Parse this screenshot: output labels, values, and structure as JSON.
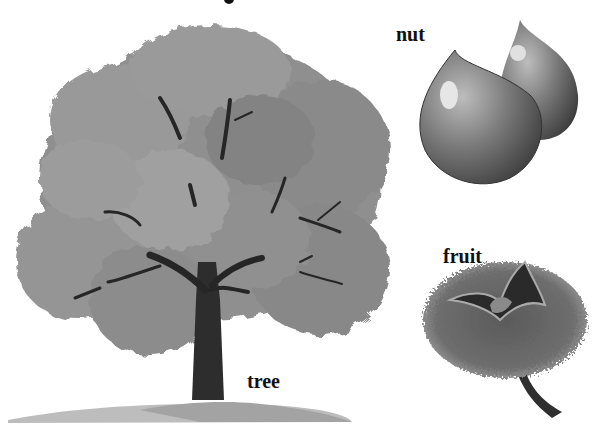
{
  "labels": {
    "nut": "nut",
    "fruit": "fruit",
    "tree": "tree"
  },
  "illustrations": [
    {
      "name": "tree",
      "description": "broad deciduous tree with grey foliage and dark trunk on a small mound"
    },
    {
      "name": "nut",
      "description": "two glossy teardrop-shaped nuts"
    },
    {
      "name": "fruit",
      "description": "spiny husk split open showing nut inside, with short stem"
    }
  ],
  "colors": {
    "background": "#ffffff",
    "foliage": "#8f8f8f",
    "foliage_light": "#a8a8a8",
    "foliage_dark": "#767676",
    "trunk": "#2a2a2a",
    "ground": "#b5b5b5",
    "nut": "#6e6e6e",
    "nut_highlight": "#e6e6e6",
    "husk": "#555555"
  }
}
